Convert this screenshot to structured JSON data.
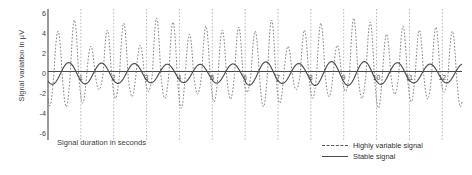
{
  "chart_data": {
    "type": "line",
    "title": "",
    "xlabel": "Signal duration in seconds",
    "ylabel": "Signal variation in µV",
    "xlim": [
      0,
      12.6
    ],
    "ylim": [
      -6.6,
      6.4
    ],
    "xticks": [
      "1",
      "2",
      "3",
      "4",
      "5",
      "6",
      "7",
      "8",
      "9",
      "10",
      "11",
      "12"
    ],
    "xtick_values": [
      1,
      2,
      3,
      4,
      5,
      6,
      7,
      8,
      9,
      10,
      11,
      12
    ],
    "yticks": [
      "6",
      "4",
      "2",
      "0",
      "-2",
      "-4",
      "-6"
    ],
    "ytick_values": [
      6,
      4,
      2,
      0,
      -2,
      -4,
      -6
    ],
    "grid": "vertical-dashed",
    "legend_position": "bottom-right",
    "series": [
      {
        "name": "Highly variable signal",
        "style": "dashed",
        "color": "#6e6e6e",
        "amplitude_range": [
          3.5,
          5.6
        ],
        "cycles_per_second": 2,
        "peaks": [
          4.2,
          2.8,
          5.3,
          3.2,
          2.7,
          1.8,
          4.3,
          3.4,
          5.0,
          2.4,
          2.8,
          2.1,
          5.5,
          2.3,
          5.1,
          3.1,
          3.9,
          1.9,
          4.7,
          3.2,
          4.3,
          2.5,
          4.6,
          1.6
        ]
      },
      {
        "name": "Stable signal",
        "style": "solid",
        "color": "#4b4b4b",
        "amplitude_range": [
          0.9,
          1.25
        ],
        "cycles_per_second": 1
      }
    ]
  },
  "legend": {
    "items": [
      {
        "label": "Highly variable signal",
        "style": "dashed"
      },
      {
        "label": "Stable signal",
        "style": "solid"
      }
    ]
  },
  "colors": {
    "axis": "#4a4a4a",
    "grid": "#9a9a9a",
    "variable_series": "#6e6e6e",
    "stable_series": "#4b4b4b",
    "text": "#3d3d3d"
  }
}
